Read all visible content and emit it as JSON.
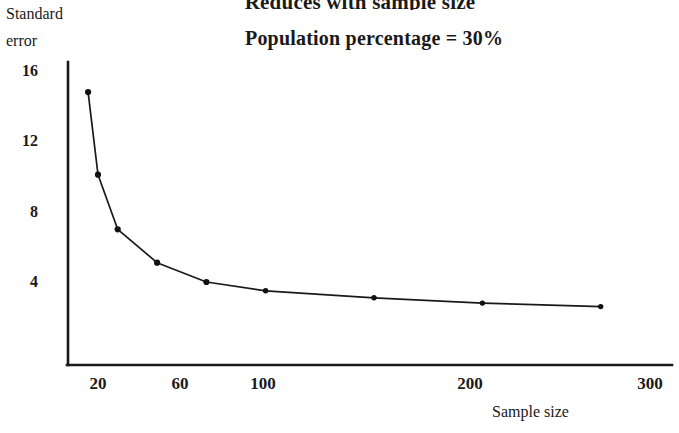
{
  "chart_data": {
    "type": "line",
    "title": "Reduces with sample size",
    "subtitle": "Population percentage = 30%",
    "xlabel": "Sample size",
    "ylabel": "Standard error",
    "ylabel_line1": "Standard",
    "ylabel_line2": "error",
    "grid": false,
    "legend": null,
    "xlim": [
      10,
      320
    ],
    "ylim": [
      0,
      17
    ],
    "xticks": [
      {
        "label": "20",
        "value": 20
      },
      {
        "label": "60",
        "value": 60
      },
      {
        "label": "100",
        "value": 100
      },
      {
        "label": "200",
        "value": 200
      },
      {
        "label": "300",
        "value": 300
      }
    ],
    "yticks": [
      {
        "label": "16",
        "value": 16
      },
      {
        "label": "12",
        "value": 12
      },
      {
        "label": "8",
        "value": 8
      },
      {
        "label": "4",
        "value": 4
      }
    ],
    "x": [
      15,
      20,
      30,
      50,
      75,
      105,
      160,
      215,
      275
    ],
    "values": [
      14.8,
      10.1,
      7.0,
      5.1,
      4.0,
      3.5,
      3.1,
      2.8,
      2.6
    ],
    "series": [
      {
        "name": "Standard error",
        "x": [
          15,
          20,
          30,
          50,
          75,
          105,
          160,
          215,
          275
        ],
        "values": [
          14.8,
          10.1,
          7.0,
          5.1,
          4.0,
          3.5,
          3.1,
          2.8,
          2.6
        ]
      }
    ],
    "marker": "filled-circle",
    "line_color": "#1a1a1a",
    "marker_color": "#111111",
    "axis_color": "#1a1a1a",
    "background": "#ffffff"
  }
}
